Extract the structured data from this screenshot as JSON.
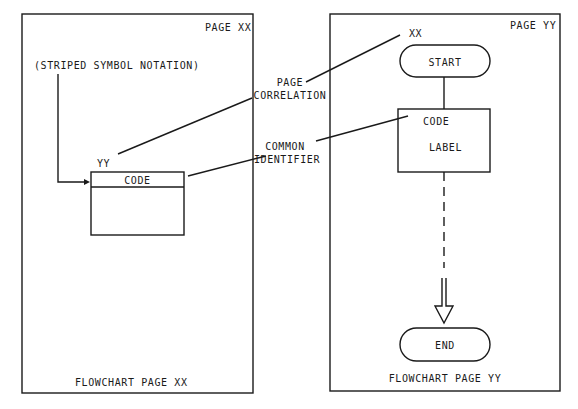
{
  "left_page": {
    "page_label": "PAGE XX",
    "notation_label": "(STRIPED SYMBOL NOTATION)",
    "page_ref": "YY",
    "stripe_text": "CODE",
    "footer": "FLOWCHART PAGE XX"
  },
  "right_page": {
    "page_label": "PAGE YY",
    "page_ref": "XX",
    "start_label": "START",
    "process_code": "CODE",
    "process_label": "LABEL",
    "end_label": "END",
    "footer": "FLOWCHART PAGE YY"
  },
  "callouts": {
    "page_correlation_line1": "PAGE",
    "page_correlation_line2": "CORRELATION",
    "common_identifier_line1": "COMMON",
    "common_identifier_line2": "IDENTIFIER"
  },
  "colors": {
    "line": "#1a1a1a",
    "background": "#ffffff"
  }
}
